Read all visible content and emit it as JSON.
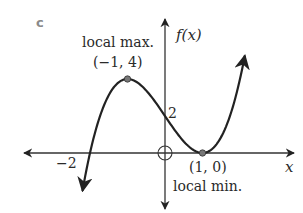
{
  "part_label": "c",
  "axes": {
    "x_label": "x",
    "y_label": "f(x)",
    "origin": {
      "px": 165,
      "py": 153
    },
    "x_scale": 37.5,
    "y_scale": 18.5
  },
  "annotations": {
    "max_title": "local max.",
    "max_point": "(−1, 4)",
    "min_title": "local min.",
    "min_point": "(1, 0)",
    "y_intercept": "2",
    "x_intercept": "−2"
  },
  "function": {
    "expression": "f(x) = (x+2)(x-1)^2",
    "x_range": [
      -2.2,
      2.13
    ],
    "critical_points": [
      {
        "type": "local max",
        "x": -1,
        "y": 4
      },
      {
        "type": "local min",
        "x": 1,
        "y": 0
      }
    ],
    "intercepts": {
      "x": [
        -2,
        1
      ],
      "y": 2
    }
  },
  "colors": {
    "curve": "#222222",
    "axis": "#333333",
    "point": "#777777",
    "part_label": "#8a8a8a"
  }
}
